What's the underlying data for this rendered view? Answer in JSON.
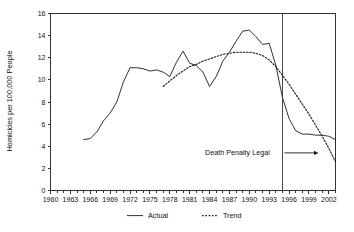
{
  "chart_data": {
    "type": "line",
    "title": "",
    "xlabel": "",
    "ylabel": "Homicides per 100,000 People",
    "xlim": [
      1960,
      2003
    ],
    "ylim": [
      0,
      16
    ],
    "ytick_step": 2,
    "yticks": [
      0,
      2,
      4,
      6,
      8,
      10,
      12,
      14,
      16
    ],
    "ytick_labels": [
      "0",
      "2",
      "4",
      "6",
      "8",
      "10",
      "12",
      "14",
      "16"
    ],
    "xticks": [
      1960,
      1963,
      1966,
      1969,
      1972,
      1975,
      1978,
      1981,
      1984,
      1987,
      1990,
      1993,
      1996,
      1999,
      2002
    ],
    "xtick_labels": [
      "1960",
      "1963",
      "1966",
      "1969",
      "1972",
      "1975",
      "1978",
      "1981",
      "1984",
      "1987",
      "1990",
      "1993",
      "1996",
      "1999",
      "2002"
    ],
    "xtick_minor_step": 1,
    "grid": false,
    "legend_position": "bottom",
    "series": [
      {
        "name": "Actual",
        "style": "solid",
        "color": "#1a1a1a",
        "x": [
          1965,
          1966,
          1967,
          1968,
          1969,
          1970,
          1971,
          1972,
          1973,
          1974,
          1975,
          1976,
          1977,
          1978,
          1979,
          1980,
          1981,
          1982,
          1983,
          1984,
          1985,
          1986,
          1987,
          1988,
          1989,
          1990,
          1991,
          1992,
          1993,
          1994,
          1995,
          1996,
          1997,
          1998,
          1999,
          2000,
          2001,
          2002,
          2003
        ],
        "values": [
          4.6,
          4.7,
          5.3,
          6.3,
          7.0,
          8.0,
          9.8,
          11.1,
          11.1,
          11.0,
          10.8,
          10.9,
          10.7,
          10.3,
          11.6,
          12.6,
          11.5,
          11.3,
          10.7,
          9.4,
          10.3,
          11.7,
          12.5,
          13.5,
          14.4,
          14.5,
          13.9,
          13.2,
          13.3,
          11.3,
          8.4,
          6.5,
          5.4,
          5.1,
          5.1,
          5.0,
          5.0,
          4.9,
          4.6
        ]
      },
      {
        "name": "Trend",
        "style": "dotted",
        "color": "#1a1a1a",
        "x": [
          1977,
          1978,
          1979,
          1980,
          1981,
          1982,
          1983,
          1984,
          1985,
          1986,
          1987,
          1988,
          1989,
          1990,
          1991,
          1992,
          1993,
          1994,
          1995,
          1996,
          1997,
          1998,
          1999,
          2000,
          2001,
          2002,
          2003
        ],
        "values": [
          9.4,
          9.9,
          10.4,
          10.8,
          11.2,
          11.4,
          11.7,
          11.9,
          12.1,
          12.3,
          12.4,
          12.5,
          12.5,
          12.5,
          12.4,
          12.2,
          11.8,
          11.2,
          10.4,
          9.6,
          8.7,
          7.8,
          6.9,
          5.9,
          4.9,
          3.8,
          2.6
        ]
      }
    ],
    "annotations": [
      {
        "name": "death-penalty-legal",
        "text": "Death Penalty Legal",
        "x": 1995,
        "type": "vline-with-arrow",
        "arrow_direction": "right",
        "label_x": 1988.2,
        "label_y": 3.2
      }
    ]
  },
  "legend": {
    "items": [
      {
        "label": "Actual",
        "style": "solid"
      },
      {
        "label": "Trend",
        "style": "dotted"
      }
    ]
  }
}
